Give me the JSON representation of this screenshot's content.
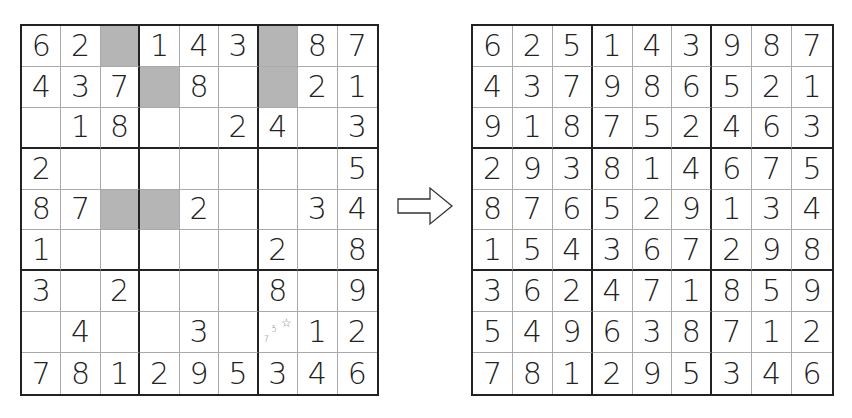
{
  "puzzle": {
    "rows": [
      [
        "6",
        "2",
        "",
        "1",
        "4",
        "3",
        "",
        "8",
        "7"
      ],
      [
        "4",
        "3",
        "7",
        "",
        "8",
        "",
        "",
        "2",
        "1"
      ],
      [
        "",
        "1",
        "8",
        "",
        "",
        "2",
        "4",
        "",
        "3"
      ],
      [
        "2",
        "",
        "",
        "",
        "",
        "",
        "",
        "",
        "5"
      ],
      [
        "8",
        "7",
        "",
        "",
        "2",
        "",
        "",
        "3",
        "4"
      ],
      [
        "1",
        "",
        "",
        "",
        "",
        "",
        "2",
        "",
        "8"
      ],
      [
        "3",
        "",
        "2",
        "",
        "",
        "",
        "8",
        "",
        "9"
      ],
      [
        "",
        "4",
        "",
        "",
        "3",
        "",
        "",
        "1",
        "2"
      ],
      [
        "7",
        "8",
        "1",
        "2",
        "9",
        "5",
        "3",
        "4",
        "6"
      ]
    ],
    "shaded_cells": [
      [
        0,
        2
      ],
      [
        0,
        6
      ],
      [
        1,
        3
      ],
      [
        1,
        6
      ],
      [
        4,
        2
      ],
      [
        4,
        3
      ]
    ],
    "annotations": [
      {
        "row": 7,
        "col": 6,
        "pencil_marks": [
          "5",
          "7"
        ],
        "star": "☆"
      }
    ]
  },
  "arrow": {
    "icon": "right-arrow-icon"
  },
  "solution": {
    "rows": [
      [
        "6",
        "2",
        "5",
        "1",
        "4",
        "3",
        "9",
        "8",
        "7"
      ],
      [
        "4",
        "3",
        "7",
        "9",
        "8",
        "6",
        "5",
        "2",
        "1"
      ],
      [
        "9",
        "1",
        "8",
        "7",
        "5",
        "2",
        "4",
        "6",
        "3"
      ],
      [
        "2",
        "9",
        "3",
        "8",
        "1",
        "4",
        "6",
        "7",
        "5"
      ],
      [
        "8",
        "7",
        "6",
        "5",
        "2",
        "9",
        "1",
        "3",
        "4"
      ],
      [
        "1",
        "5",
        "4",
        "3",
        "6",
        "7",
        "2",
        "9",
        "8"
      ],
      [
        "3",
        "6",
        "2",
        "4",
        "7",
        "1",
        "8",
        "5",
        "9"
      ],
      [
        "5",
        "4",
        "9",
        "6",
        "3",
        "8",
        "7",
        "1",
        "2"
      ],
      [
        "7",
        "8",
        "1",
        "2",
        "9",
        "5",
        "3",
        "4",
        "6"
      ]
    ]
  },
  "colors": {
    "grid_line": "#222222",
    "thin_line": "#aaaaaa",
    "shade": "#b5b5b5",
    "pencil": "#777777"
  }
}
